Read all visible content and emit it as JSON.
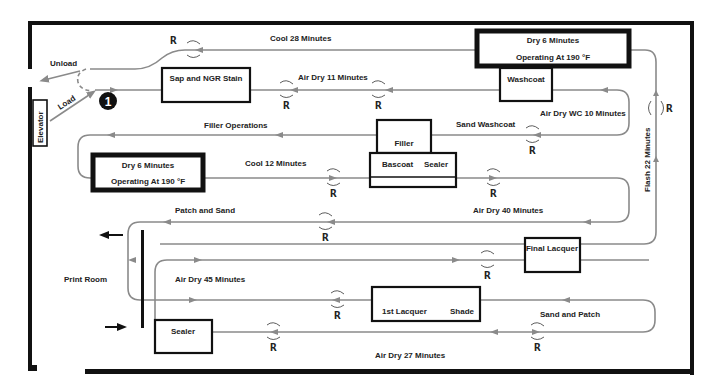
{
  "diagram": {
    "type": "finishing-line-floor-plan",
    "stations": {
      "elevator": "Elevator",
      "start_marker": "1",
      "sap_stain": "Sap and NGR Stain",
      "washcoat": "Washcoat",
      "oven_top": {
        "line1": "Dry 6 Minutes",
        "line2": "Operating At 190 °F"
      },
      "oven_left": {
        "line1": "Dry 6 Minutes",
        "line2": "Operating At 190 °F"
      },
      "filler": "Filler",
      "bascoat": "Bascoat",
      "sealer_upper": "Sealer",
      "final_lacquer": "Final Lacquer",
      "first_lacquer": "1st Lacquer",
      "shade": "Shade",
      "sealer_lower": "Sealer"
    },
    "labels": {
      "unload": "Unload",
      "load": "Load",
      "cool_28": "Cool 28 Minutes",
      "air_dry_11": "Air Dry 11 Minutes",
      "air_dry_wc_10": "Air Dry WC 10 Minutes",
      "filler_operations": "Filler Operations",
      "sand_washcoat": "Sand Washcoat",
      "cool_12": "Cool 12 Minutes",
      "flash_22": "Flash 22 Minutes",
      "patch_and_sand": "Patch and Sand",
      "air_dry_40": "Air Dry 40 Minutes",
      "print_room": "Print Room",
      "air_dry_45": "Air Dry 45 Minutes",
      "sand_and_patch": "Sand and Patch",
      "air_dry_27": "Air Dry 27 Minutes"
    },
    "rotation_marker": "R",
    "colors": {
      "conveyor": "#8a8a8a",
      "walls": "#111111",
      "text": "#222222",
      "background": "#ffffff"
    }
  }
}
